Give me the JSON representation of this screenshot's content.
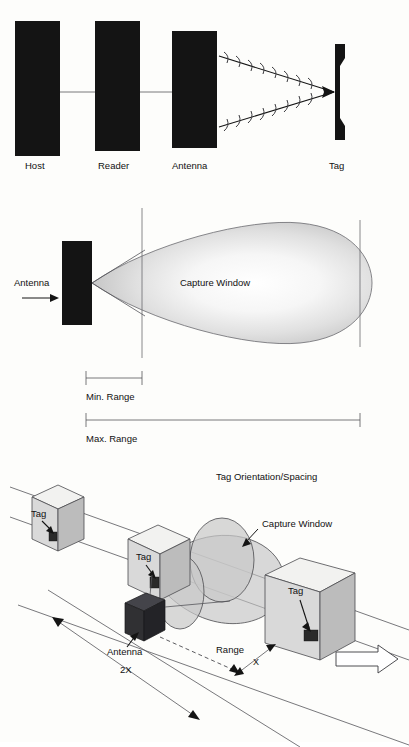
{
  "figure": {
    "kind": "rfid-system-diagram",
    "background_color": "#fdfdfb",
    "ink_color": "#141414"
  },
  "panel_top": {
    "name": "rfid-signal-path",
    "blocks": [
      {
        "label": "Host"
      },
      {
        "label": "Reader"
      },
      {
        "label": "Antenna"
      },
      {
        "label": "Tag"
      }
    ],
    "connector_note": "host-reader-antenna wired link",
    "radiation_note": "antenna radiates toward tag"
  },
  "panel_middle": {
    "name": "capture-window-range",
    "antenna_label": "Antenna",
    "window_label": "Capture Window",
    "min_range_label": "Min. Range",
    "max_range_label": "Max. Range"
  },
  "panel_bottom": {
    "name": "tag-orientation-spacing",
    "title": "Tag Orientation/Spacing",
    "window_label": "Capture Window",
    "antenna_label": "Antenna",
    "range_label": "Range",
    "spacing_label": "2X",
    "gap_label": "X",
    "tags": [
      {
        "label": "Tag"
      },
      {
        "label": "Tag"
      },
      {
        "label": "Tag"
      }
    ],
    "travel_note": "conveyor direction arrow"
  }
}
